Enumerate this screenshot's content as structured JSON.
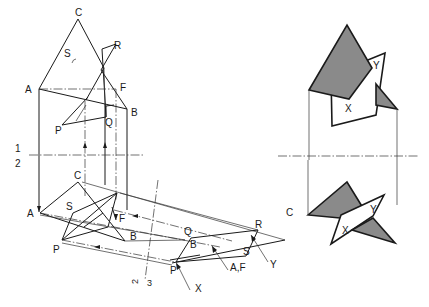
{
  "diagram": {
    "type": "descriptive-geometry intersection of two planes (triangle ABC and quadrilateral PQRS)",
    "caption": "Fig. 221",
    "left_view": {
      "elevation_labels": [
        "C",
        "S",
        "R",
        "A",
        "F",
        "B",
        "P",
        "Q"
      ],
      "reference_line_labels": {
        "upper": "1",
        "lower": "2"
      },
      "auxiliary_line_label": {
        "top": "2",
        "bottom": "3"
      },
      "plan_labels": [
        "C",
        "A",
        "S",
        "F",
        "B",
        "P"
      ],
      "auxiliary_view_labels": [
        "R",
        "C",
        "Q",
        "B",
        "S",
        "Y",
        "A,F",
        "P",
        "X"
      ]
    },
    "right_view": {
      "upper_labels": [
        "Y",
        "X"
      ],
      "lower_labels": [
        "Y",
        "X"
      ],
      "shade_color": "#8a8a8a"
    }
  },
  "labels": {
    "caption": "Fig. 221",
    "C1": "C",
    "S1": "S",
    "R1": "R",
    "A1": "A",
    "F1": "F",
    "B1": "B",
    "P1": "P",
    "Q1": "Q",
    "one": "1",
    "two": "2",
    "C2": "C",
    "A2": "A",
    "S2": "S",
    "F2": "F",
    "B2": "B",
    "P2": "P",
    "aux2": "2",
    "aux3": "3",
    "R3": "R",
    "C3": "C",
    "Q3": "Q",
    "B3": "B",
    "S3": "S",
    "Y3": "Y",
    "AF3": "A,F",
    "P3": "P",
    "X3": "X",
    "Yr1": "Y",
    "Xr1": "X",
    "Yr2": "Y",
    "Xr2": "X"
  }
}
